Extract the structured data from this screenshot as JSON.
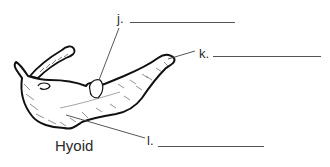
{
  "figure": {
    "title": "Hyoid",
    "labels": [
      {
        "id": "j",
        "text": "j.",
        "answer": ""
      },
      {
        "id": "k",
        "text": "k.",
        "answer": ""
      },
      {
        "id": "l",
        "text": "l.",
        "answer": ""
      }
    ]
  },
  "colors": {
    "ink": "#2a2a2a",
    "bone_fill": "#ffffff",
    "line": "#555555"
  }
}
